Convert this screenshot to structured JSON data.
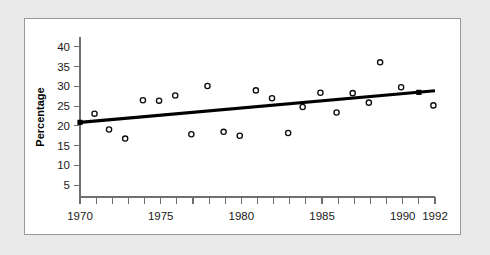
{
  "figure": {
    "panel_background": "#ffffff",
    "outer_background": "#e9e9e9",
    "border_color": "#9a9a9a"
  },
  "chart_data": {
    "type": "scatter",
    "title": "",
    "subtitle": "",
    "xlabel": "",
    "ylabel": "Percentage",
    "xlim": [
      1970,
      1992
    ],
    "ylim": [
      0,
      41
    ],
    "grid": false,
    "legend": null,
    "x_tick_values": [
      1970,
      1971,
      1972,
      1973,
      1974,
      1975,
      1976,
      1977,
      1978,
      1979,
      1980,
      1981,
      1982,
      1983,
      1984,
      1985,
      1986,
      1987,
      1988,
      1989,
      1990,
      1991,
      1992
    ],
    "x_tick_labels": [
      "1970",
      "",
      "",
      "",
      "",
      "1975",
      "",
      "",
      "",
      "",
      "1980",
      "",
      "",
      "",
      "",
      "1985",
      "",
      "",
      "",
      "",
      "1990",
      "",
      "1992"
    ],
    "y_tick_values": [
      5,
      10,
      15,
      20,
      25,
      30,
      35,
      40
    ],
    "y_tick_labels": [
      "5",
      "10",
      "15",
      "20",
      "25",
      "30",
      "35",
      "40"
    ],
    "marker_style": "open-circle",
    "marker_color": "#0d0d0d",
    "points": [
      {
        "x": 1970.9,
        "y": 23.1
      },
      {
        "x": 1971.8,
        "y": 19.1
      },
      {
        "x": 1972.8,
        "y": 16.8
      },
      {
        "x": 1973.9,
        "y": 26.5
      },
      {
        "x": 1974.9,
        "y": 26.4
      },
      {
        "x": 1975.9,
        "y": 27.7
      },
      {
        "x": 1976.9,
        "y": 17.9
      },
      {
        "x": 1977.9,
        "y": 30.1
      },
      {
        "x": 1978.9,
        "y": 18.5
      },
      {
        "x": 1979.9,
        "y": 17.5
      },
      {
        "x": 1980.9,
        "y": 29.0
      },
      {
        "x": 1981.9,
        "y": 27.0
      },
      {
        "x": 1982.9,
        "y": 18.2
      },
      {
        "x": 1983.8,
        "y": 24.8
      },
      {
        "x": 1984.9,
        "y": 28.4
      },
      {
        "x": 1985.9,
        "y": 23.4
      },
      {
        "x": 1986.9,
        "y": 28.3
      },
      {
        "x": 1987.9,
        "y": 25.9
      },
      {
        "x": 1988.6,
        "y": 36.1
      },
      {
        "x": 1989.9,
        "y": 29.8
      },
      {
        "x": 1991.9,
        "y": 25.2
      }
    ],
    "trend_line": {
      "name": "linear fit",
      "color": "#000000",
      "x_start": 1970.0,
      "y_start": 20.9,
      "x_end": 1992.0,
      "y_end": 28.9,
      "knots": [
        {
          "x": 1970.0,
          "y": 20.9
        },
        {
          "x": 1991.0,
          "y": 28.5
        }
      ]
    }
  }
}
